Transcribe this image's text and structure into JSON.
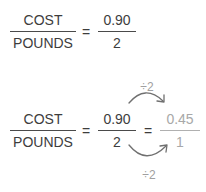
{
  "equation_1": {
    "left_fraction": {
      "numerator": "COST",
      "denominator": "POUNDS"
    },
    "equals": "=",
    "right_fraction": {
      "numerator": "0.90",
      "denominator": "2"
    }
  },
  "equation_2": {
    "left_fraction": {
      "numerator": "COST",
      "denominator": "POUNDS"
    },
    "equals_1": "=",
    "middle_fraction": {
      "numerator": "0.90",
      "denominator": "2"
    },
    "equals_2": "=",
    "result_fraction": {
      "numerator": "0.45",
      "denominator": "1"
    },
    "top_operation": {
      "label": "÷2",
      "icon": "curved-arrow-right-icon"
    },
    "bottom_operation": {
      "label": "÷2",
      "icon": "curved-arrow-right-icon"
    }
  },
  "colors": {
    "text": "#3d3d3d",
    "faded_text": "#a8a8a8",
    "arrow": "#707070"
  }
}
